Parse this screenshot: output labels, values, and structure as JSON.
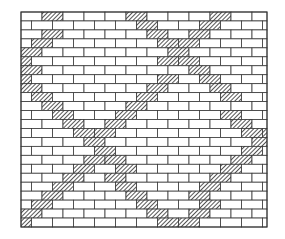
{
  "figure": {
    "colors": {
      "background": "#ffffff",
      "mortar_line": "#3a3a3a",
      "hatch": "#2a2a2a",
      "brick_fill": "#ffffff"
    },
    "wall": {
      "x": 21,
      "y": 12,
      "width": 246,
      "height": 215,
      "rows": 24,
      "brick_width": 21,
      "bond": "running"
    },
    "bands": [
      {
        "name": "band-top-left",
        "from": [
          63,
          12
        ],
        "to": [
          21,
          80
        ]
      },
      {
        "name": "band-left-descending",
        "from": [
          21,
          80
        ],
        "to": [
          178,
          227
        ]
      },
      {
        "name": "band-top-center-descending",
        "from": [
          136,
          12
        ],
        "to": [
          265,
          140
        ]
      },
      {
        "name": "band-top-right-ascending",
        "from": [
          222,
          12
        ],
        "to": [
          26,
          227
        ]
      },
      {
        "name": "band-bottom-right-ascending",
        "from": [
          178,
          227
        ],
        "to": [
          265,
          140
        ]
      }
    ],
    "band_half_width": 7
  }
}
